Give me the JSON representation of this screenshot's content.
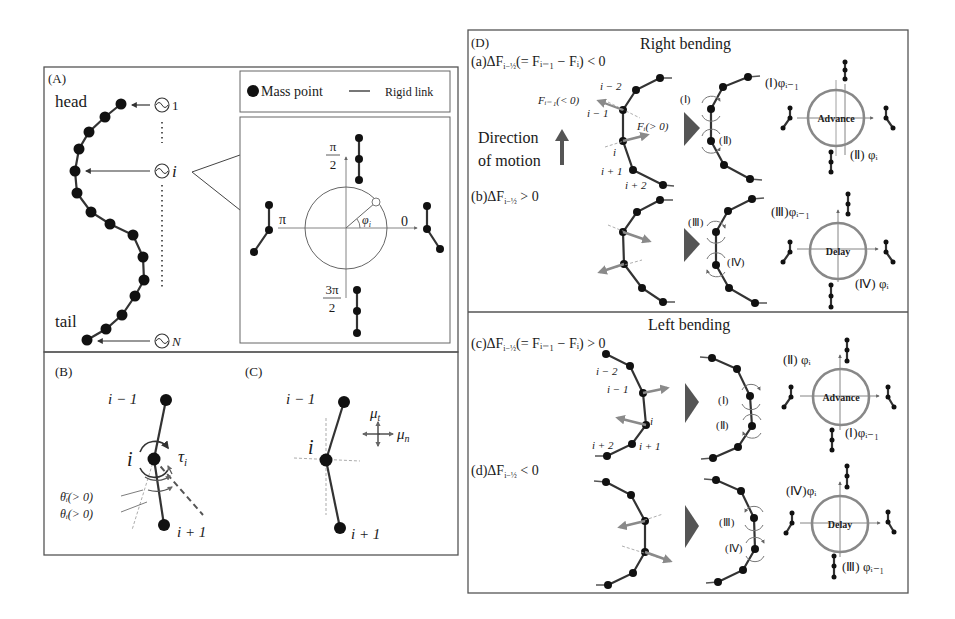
{
  "figure": {
    "panels": {
      "A": {
        "tag": "(A)",
        "head_label": "head",
        "tail_label": "tail",
        "oscillators": [
          {
            "symbol": "∿",
            "index": "1"
          },
          {
            "symbol": "∿",
            "index": "i"
          },
          {
            "symbol": "∿",
            "index": "N"
          }
        ],
        "legend": {
          "mass_point": "Mass point",
          "rigid_link": "Rigid link"
        },
        "phase_diagram": {
          "top": {
            "num": "π",
            "den": "2"
          },
          "left": "π",
          "right": "0",
          "bottom": {
            "num": "3π",
            "den": "2"
          },
          "angle_label": "φ",
          "angle_sub": "i"
        }
      },
      "B": {
        "tag": "(B)",
        "node_prev": "i − 1",
        "node_cur": "i",
        "node_next": "i + 1",
        "torque": "τ",
        "torque_sub": "i",
        "theta_bar": "θ̄ᵢ(> 0)",
        "theta": "θᵢ(> 0)"
      },
      "C": {
        "tag": "(C)",
        "node_prev": "i − 1",
        "node_cur": "i",
        "node_next": "i + 1",
        "mu_t": "μ",
        "mu_t_sub": "t",
        "mu_n": "μ",
        "mu_n_sub": "n"
      },
      "D": {
        "tag": "(D)",
        "right_title": "Right bending",
        "left_title": "Left bending",
        "direction_label_1": "Direction",
        "direction_label_2": "of motion",
        "cases": {
          "a": {
            "label": "(a)ΔF",
            "sub": "i−½",
            "rest": "(= Fᵢ₋₁ − Fᵢ) < 0"
          },
          "b": {
            "label": "(b)ΔF",
            "sub": "i−½",
            "rest": " > 0"
          },
          "c": {
            "label": "(c)ΔF",
            "sub": "i−½",
            "rest": "(= Fᵢ₋₁ − Fᵢ) > 0"
          },
          "d": {
            "label": "(d)ΔF",
            "sub": "i−½",
            "rest": " < 0"
          }
        },
        "a_labels": {
          "i_minus_2": "i − 2",
          "i_minus_1": "i − 1",
          "i": "i",
          "i_plus_1": "i + 1",
          "i_plus_2": "i + 2",
          "F_prev": "Fᵢ₋₁(< 0)",
          "F_cur": "Fᵢ(> 0)"
        },
        "c_labels": {
          "i_minus_2": "i − 2",
          "i_minus_1": "i − 1",
          "i": "i",
          "i_plus_1": "i + 1",
          "i_plus_2": "i + 2"
        },
        "roman": {
          "I": "(Ⅰ)",
          "II": "(Ⅱ)",
          "III": "(Ⅲ)",
          "IV": "(Ⅳ)"
        },
        "rings": {
          "a": {
            "center": "Advance",
            "top": "(Ⅰ)φᵢ₋₁",
            "bottom": "(Ⅱ) φᵢ"
          },
          "b": {
            "center": "Delay",
            "top": "(Ⅲ)φᵢ₋₁",
            "bottom": "(Ⅳ) φᵢ"
          },
          "c": {
            "center": "Advance",
            "top": "(Ⅱ) φᵢ",
            "bottom": "(Ⅰ)φᵢ₋₁"
          },
          "d": {
            "center": "Delay",
            "top": "(Ⅳ)φᵢ",
            "bottom": "(Ⅲ) φᵢ₋₁"
          }
        }
      }
    },
    "colors": {
      "ink": "#1a1a1a",
      "panel_border": "#555555",
      "force_arrow": "#8a8a8a",
      "play_triangle": "#555555"
    }
  }
}
